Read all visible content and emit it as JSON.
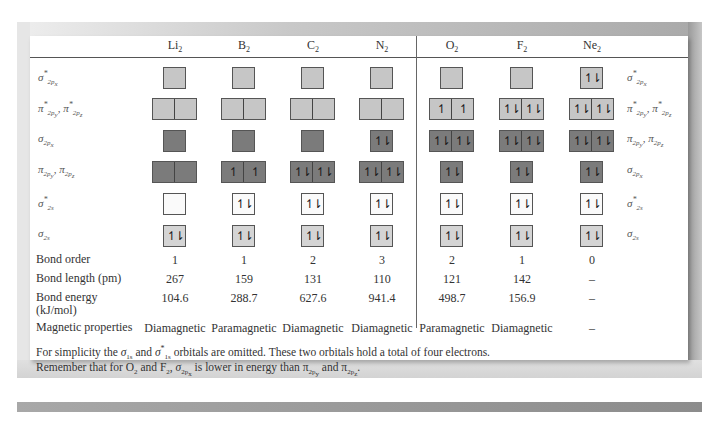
{
  "molecules": [
    {
      "symbol": "Li",
      "sub": "2",
      "x": 175
    },
    {
      "symbol": "B",
      "sub": "2",
      "x": 244
    },
    {
      "symbol": "C",
      "sub": "2",
      "x": 313
    },
    {
      "symbol": "N",
      "sub": "2",
      "x": 382
    },
    {
      "symbol": "O",
      "sub": "2",
      "x": 452
    },
    {
      "symbol": "F",
      "sub": "2",
      "x": 522
    },
    {
      "symbol": "Ne",
      "sub": "2",
      "x": 592
    }
  ],
  "orbital_rows_left": [
    {
      "label": "σ*2px",
      "html": "σ<sup>*</sup><sub>2p<sub>x</sub></sub>"
    },
    {
      "label": "π*2py, π*2pz",
      "html": "π<sup>*</sup><sub>2p<sub>y</sub></sub>, π<sup>*</sup><sub>2p<sub>z</sub></sub>"
    },
    {
      "label": "σ2px",
      "html": "σ<sub>2p<sub>x</sub></sub>"
    },
    {
      "label": "π2py, π2pz",
      "html": "π<sub>2p<sub>y</sub></sub>, π<sub>2p<sub>z</sub></sub>"
    },
    {
      "label": "σ*2s",
      "html": "σ<sup>*</sup><sub>2s</sub>"
    },
    {
      "label": "σ2s",
      "html": "σ<sub>2s</sub>"
    }
  ],
  "orbital_rows_right": [
    {
      "label": "σ*2px",
      "html": "σ<sup>*</sup><sub>2p<sub>x</sub></sub>"
    },
    {
      "label": "π*2py, π*2pz",
      "html": "π<sup>*</sup><sub>2p<sub>y</sub></sub>, π<sup>*</sup><sub>2p<sub>z</sub></sub>"
    },
    {
      "label": "π2py, π2pz",
      "html": "π<sub>2p<sub>y</sub></sub>, π<sub>2p<sub>z</sub></sub>"
    },
    {
      "label": "σ2px",
      "html": "σ<sub>2p<sub>x</sub></sub>"
    },
    {
      "label": "σ*2s",
      "html": "σ<sup>*</sup><sub>2s</sub>"
    },
    {
      "label": "σ2s",
      "html": "σ<sub>2s</sub>"
    }
  ],
  "row_y": [
    67,
    98,
    130,
    161,
    193,
    225
  ],
  "electron_glyphs": {
    "up": "↿",
    "pair": "↿⇂",
    "empty": ""
  },
  "orbital_boxes": [
    [
      {
        "cells": [
          "empty"
        ],
        "color": "light"
      },
      {
        "cells": [
          "empty",
          "empty"
        ],
        "color": "light"
      },
      {
        "cells": [
          "empty"
        ],
        "color": "dark"
      },
      {
        "cells": [
          "empty",
          "empty"
        ],
        "color": "dark"
      },
      {
        "cells": [
          "empty"
        ],
        "color": "white"
      },
      {
        "cells": [
          "pair"
        ],
        "color": "pale"
      }
    ],
    [
      {
        "cells": [
          "empty"
        ],
        "color": "light"
      },
      {
        "cells": [
          "empty",
          "empty"
        ],
        "color": "light"
      },
      {
        "cells": [
          "empty"
        ],
        "color": "dark"
      },
      {
        "cells": [
          "up",
          "up"
        ],
        "color": "dark"
      },
      {
        "cells": [
          "pair"
        ],
        "color": "white"
      },
      {
        "cells": [
          "pair"
        ],
        "color": "pale"
      }
    ],
    [
      {
        "cells": [
          "empty"
        ],
        "color": "light"
      },
      {
        "cells": [
          "empty",
          "empty"
        ],
        "color": "light"
      },
      {
        "cells": [
          "empty"
        ],
        "color": "dark"
      },
      {
        "cells": [
          "pair",
          "pair"
        ],
        "color": "dark"
      },
      {
        "cells": [
          "pair"
        ],
        "color": "white"
      },
      {
        "cells": [
          "pair"
        ],
        "color": "pale"
      }
    ],
    [
      {
        "cells": [
          "empty"
        ],
        "color": "light"
      },
      {
        "cells": [
          "empty",
          "empty"
        ],
        "color": "light"
      },
      {
        "cells": [
          "pair"
        ],
        "color": "dark"
      },
      {
        "cells": [
          "pair",
          "pair"
        ],
        "color": "dark"
      },
      {
        "cells": [
          "pair"
        ],
        "color": "white"
      },
      {
        "cells": [
          "pair"
        ],
        "color": "pale"
      }
    ],
    [
      {
        "cells": [
          "empty"
        ],
        "color": "light"
      },
      {
        "cells": [
          "up",
          "up"
        ],
        "color": "light"
      },
      {
        "cells": [
          "pair",
          "pair"
        ],
        "color": "dark"
      },
      {
        "cells": [
          "pair"
        ],
        "color": "dark"
      },
      {
        "cells": [
          "pair"
        ],
        "color": "white"
      },
      {
        "cells": [
          "pair"
        ],
        "color": "pale"
      }
    ],
    [
      {
        "cells": [
          "empty"
        ],
        "color": "light"
      },
      {
        "cells": [
          "pair",
          "pair"
        ],
        "color": "light"
      },
      {
        "cells": [
          "pair",
          "pair"
        ],
        "color": "dark"
      },
      {
        "cells": [
          "pair"
        ],
        "color": "dark"
      },
      {
        "cells": [
          "pair"
        ],
        "color": "white"
      },
      {
        "cells": [
          "pair"
        ],
        "color": "pale"
      }
    ],
    [
      {
        "cells": [
          "pair"
        ],
        "color": "light"
      },
      {
        "cells": [
          "pair",
          "pair"
        ],
        "color": "light"
      },
      {
        "cells": [
          "pair",
          "pair"
        ],
        "color": "dark"
      },
      {
        "cells": [
          "pair"
        ],
        "color": "dark"
      },
      {
        "cells": [
          "pair"
        ],
        "color": "white"
      },
      {
        "cells": [
          "pair"
        ],
        "color": "pale"
      }
    ]
  ],
  "colors": {
    "light": "#c6c6c6",
    "dark": "#7b7b7b",
    "white": "#fafafa",
    "pale": "#d4d4d4"
  },
  "properties": [
    {
      "label": "Bond order",
      "y": 253,
      "values": [
        "1",
        "1",
        "2",
        "3",
        "2",
        "1",
        "0"
      ]
    },
    {
      "label": "Bond length (pm)",
      "y": 272,
      "values": [
        "267",
        "159",
        "131",
        "110",
        "121",
        "142",
        "–"
      ]
    },
    {
      "label": "Bond energy\n(kJ/mol)",
      "y": 291,
      "values": [
        "104.6",
        "288.7",
        "627.6",
        "941.4",
        "498.7",
        "156.9",
        "–"
      ]
    },
    {
      "label": "Magnetic properties",
      "y": 321,
      "values": [
        "Diamagnetic",
        "Paramagnetic",
        "Diamagnetic",
        "Diamagnetic",
        "Paramagnetic",
        "Diamagnetic",
        "–"
      ]
    }
  ],
  "footnotes": [
    "For simplicity the <i>σ</i><sub>1s</sub> and <i>σ</i><sup>*</sup><sub>1s</sub> orbitals are omitted.  These two orbitals hold a total of four electrons.",
    "Remember that for O<sub>2</sub> and F<sub>2</sub>, <i>σ</i><sub>2p<sub>x</sub></sub> is lower in energy than π<sub>2p<sub>y</sub></sub> and π<sub>2p<sub>z</sub></sub>."
  ]
}
